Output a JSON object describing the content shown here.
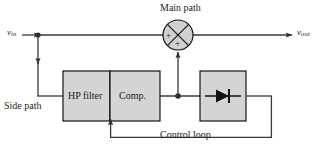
{
  "diagram": {
    "title_label": "Main path",
    "side_label": "Side path",
    "control_label": "Control loop",
    "input_signal": "v",
    "input_subscript": "in",
    "output_signal": "v",
    "output_subscript": "out",
    "blocks": [
      {
        "id": "hp-filter",
        "label": "HP filter"
      },
      {
        "id": "compressor",
        "label": "Comp."
      },
      {
        "id": "rectifier",
        "label": ""
      }
    ],
    "summing_junction": {
      "sign_left": "+",
      "sign_bottom": "+"
    },
    "colors": {
      "block_fill": "#d4d4d4",
      "block_stroke": "#000000",
      "wire": "#3a3a3a",
      "text": "#1a1a1a",
      "background": "#ffffff"
    }
  }
}
